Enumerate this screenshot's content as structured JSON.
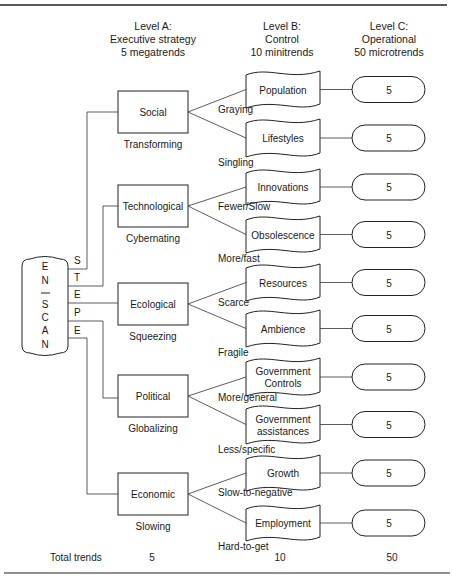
{
  "headers": {
    "level_a": [
      "Level A:",
      "Executive strategy",
      "5 megatrends"
    ],
    "level_b": [
      "Level B:",
      "Control",
      "10 minitrends"
    ],
    "level_c": [
      "Level C:",
      "Operational",
      "50 microtrends"
    ]
  },
  "enscan": {
    "letters": [
      "E",
      "N",
      "—",
      "S",
      "C",
      "A",
      "N"
    ],
    "steep": [
      "S",
      "T",
      "E",
      "P",
      "E"
    ]
  },
  "megatrends": [
    {
      "name": "Social",
      "trend": "Transforming",
      "minitrends": [
        {
          "name": [
            "Population"
          ],
          "label": "Graying",
          "count": "5"
        },
        {
          "name": [
            "Lifestyles"
          ],
          "label": "Singling",
          "count": "5"
        }
      ]
    },
    {
      "name": "Technological",
      "trend": "Cybernating",
      "minitrends": [
        {
          "name": [
            "Innovations"
          ],
          "label": "Fewer/Slow",
          "count": "5"
        },
        {
          "name": [
            "Obsolescence"
          ],
          "label": "More/fast",
          "count": "5"
        }
      ]
    },
    {
      "name": "Ecological",
      "trend": "Squeezing",
      "minitrends": [
        {
          "name": [
            "Resources"
          ],
          "label": "Scarce",
          "count": "5"
        },
        {
          "name": [
            "Ambience"
          ],
          "label": "Fragile",
          "count": "5"
        }
      ]
    },
    {
      "name": "Political",
      "trend": "Globalizing",
      "minitrends": [
        {
          "name": [
            "Government",
            "Controls"
          ],
          "label": "More/general",
          "count": "5"
        },
        {
          "name": [
            "Government",
            "assistances"
          ],
          "label": "Less/specific",
          "count": "5"
        }
      ]
    },
    {
      "name": "Economic",
      "trend": "Slowing",
      "minitrends": [
        {
          "name": [
            "Growth"
          ],
          "label": "Slow-to-negative",
          "count": "5"
        },
        {
          "name": [
            "Employment"
          ],
          "label": "Hard-to-get",
          "count": "5"
        }
      ]
    }
  ],
  "totals": {
    "label": "Total trends",
    "level_a": "5",
    "level_b": "10",
    "level_c": "50"
  }
}
